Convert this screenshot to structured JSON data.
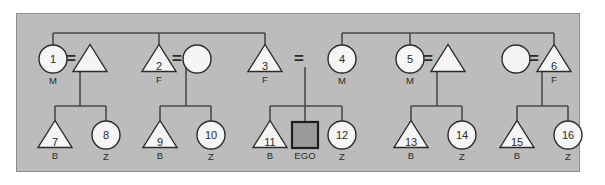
{
  "diagram": {
    "panel_color": "#bcbcbc",
    "panel_border_color": "#8d8d8d",
    "line_color": "#4a4a4a",
    "shape_fill": "#f5f5f5",
    "shape_stroke": "#2b2b2b",
    "ego_fill": "#9a9a9a",
    "ego_stroke": "#1e1e1e",
    "union_symbol": "=",
    "ego_label": "EGO",
    "generation1": [
      {
        "id": "g1-1",
        "shape": "circle",
        "number": "1",
        "label": "M",
        "cx": 53,
        "cy": 59
      },
      {
        "id": "g1-s1",
        "shape": "triangle",
        "number": "",
        "label": "",
        "cx": 90,
        "cy": 59
      },
      {
        "id": "g1-2",
        "shape": "triangle",
        "number": "2",
        "label": "F",
        "cx": 159,
        "cy": 59
      },
      {
        "id": "g1-s2",
        "shape": "circle",
        "number": "",
        "label": "",
        "cx": 197,
        "cy": 59
      },
      {
        "id": "g1-3",
        "shape": "triangle",
        "number": "3",
        "label": "F",
        "cx": 265,
        "cy": 59
      },
      {
        "id": "g1-4",
        "shape": "circle",
        "number": "4",
        "label": "M",
        "cx": 342,
        "cy": 59
      },
      {
        "id": "g1-5",
        "shape": "circle",
        "number": "5",
        "label": "M",
        "cx": 410,
        "cy": 59
      },
      {
        "id": "g1-s3",
        "shape": "triangle",
        "number": "",
        "label": "",
        "cx": 448,
        "cy": 59
      },
      {
        "id": "g1-s4",
        "shape": "circle",
        "number": "",
        "label": "",
        "cx": 516,
        "cy": 59
      },
      {
        "id": "g1-6",
        "shape": "triangle",
        "number": "6",
        "label": "F",
        "cx": 554,
        "cy": 59
      }
    ],
    "generation2": [
      {
        "id": "g2-7",
        "shape": "triangle",
        "number": "7",
        "label": "B",
        "cx": 55,
        "cy": 135
      },
      {
        "id": "g2-8",
        "shape": "circle",
        "number": "8",
        "label": "Z",
        "cx": 106,
        "cy": 135
      },
      {
        "id": "g2-9",
        "shape": "triangle",
        "number": "9",
        "label": "B",
        "cx": 160,
        "cy": 135
      },
      {
        "id": "g2-10",
        "shape": "circle",
        "number": "10",
        "label": "Z",
        "cx": 211,
        "cy": 135
      },
      {
        "id": "g2-11",
        "shape": "triangle",
        "number": "11",
        "label": "B",
        "cx": 270,
        "cy": 135
      },
      {
        "id": "g2-ego",
        "shape": "square",
        "number": "",
        "label": "EGO",
        "cx": 305,
        "cy": 135
      },
      {
        "id": "g2-12",
        "shape": "circle",
        "number": "12",
        "label": "Z",
        "cx": 342,
        "cy": 135
      },
      {
        "id": "g2-13",
        "shape": "triangle",
        "number": "13",
        "label": "B",
        "cx": 411,
        "cy": 135
      },
      {
        "id": "g2-14",
        "shape": "circle",
        "number": "14",
        "label": "Z",
        "cx": 462,
        "cy": 135
      },
      {
        "id": "g2-15",
        "shape": "triangle",
        "number": "15",
        "label": "B",
        "cx": 517,
        "cy": 135
      },
      {
        "id": "g2-16",
        "shape": "circle",
        "number": "16",
        "label": "Z",
        "cx": 568,
        "cy": 135
      }
    ],
    "unions": [
      {
        "id": "u-1",
        "left": "g1-1",
        "right": "g1-s1",
        "x": 72,
        "y": 59,
        "descent_x": 80,
        "children": [
          "g2-7",
          "g2-8"
        ]
      },
      {
        "id": "u-2",
        "left": "g1-2",
        "right": "g1-s2",
        "x": 178,
        "y": 59,
        "descent_x": 186,
        "children": [
          "g2-9",
          "g2-10"
        ]
      },
      {
        "id": "u-3",
        "left": "g1-3",
        "right": "g1-4",
        "x": 300,
        "y": 59,
        "descent_x": 305,
        "children": [
          "g2-11",
          "g2-ego",
          "g2-12"
        ]
      },
      {
        "id": "u-4",
        "left": "g1-5",
        "right": "g1-s3",
        "x": 429,
        "y": 59,
        "descent_x": 437,
        "children": [
          "g2-13",
          "g2-14"
        ]
      },
      {
        "id": "u-5",
        "left": "g1-s4",
        "right": "g1-6",
        "x": 535,
        "y": 59,
        "descent_x": 542,
        "children": [
          "g2-15",
          "g2-16"
        ]
      }
    ],
    "sibling_bars": [
      {
        "id": "sib-left",
        "y": 33,
        "x1": 53,
        "x2": 265,
        "drops": [
          53,
          159,
          265
        ]
      },
      {
        "id": "sib-right",
        "y": 33,
        "x1": 342,
        "x2": 554,
        "drops": [
          342,
          410,
          554
        ]
      }
    ],
    "child_bars": [
      {
        "id": "cb-1",
        "y": 106,
        "x1": 55,
        "x2": 106,
        "drops": [
          55,
          106
        ]
      },
      {
        "id": "cb-2",
        "y": 106,
        "x1": 160,
        "x2": 211,
        "drops": [
          160,
          211
        ]
      },
      {
        "id": "cb-3",
        "y": 106,
        "x1": 270,
        "x2": 342,
        "drops": [
          270,
          305,
          342
        ]
      },
      {
        "id": "cb-4",
        "y": 106,
        "x1": 411,
        "x2": 462,
        "drops": [
          411,
          462
        ]
      },
      {
        "id": "cb-5",
        "y": 106,
        "x1": 517,
        "x2": 568,
        "drops": [
          517,
          568
        ]
      }
    ]
  }
}
